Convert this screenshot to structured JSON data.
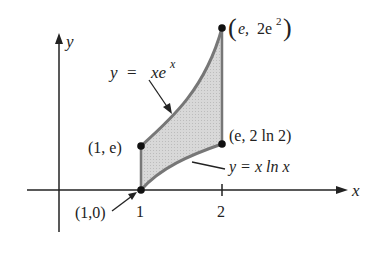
{
  "figure": {
    "axes": {
      "x_label": "x",
      "y_label": "y",
      "x_ticks": [
        "1",
        "2"
      ]
    },
    "curves": {
      "upper": {
        "equation_lhs": "y",
        "equals": "=",
        "equation_rhs": "xe",
        "exponent": "x"
      },
      "lower": {
        "equation": "y = x ln x"
      }
    },
    "points": {
      "p10": "(1,0)",
      "p1e": "(1, e)",
      "pe2ln2": "(e, 2 ln 2)",
      "top": {
        "open": "(",
        "e": "e,",
        "two": "2e",
        "exp": "2",
        "close": ")"
      }
    },
    "colors": {
      "fill": "#d4d4d4",
      "curve": "#777777",
      "ink": "#222222"
    }
  }
}
